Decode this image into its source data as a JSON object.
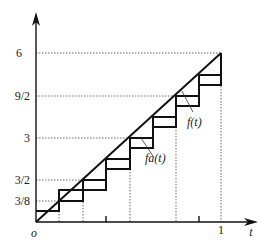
{
  "figure": {
    "axes": {
      "x_label": "t",
      "origin_label": "o",
      "x_ticks": [
        {
          "value": 1,
          "label": "1"
        }
      ],
      "y_ticks": [
        {
          "value": "3/8",
          "label": "3/8"
        },
        {
          "value": "3/2",
          "label": "3/2"
        },
        {
          "value": "3",
          "label": "3"
        },
        {
          "value": "9/2",
          "label": "9/2"
        },
        {
          "value": "6",
          "label": "6"
        }
      ]
    },
    "curves": {
      "line_label": "f(t)",
      "staircase_label": "fa(t)"
    }
  }
}
